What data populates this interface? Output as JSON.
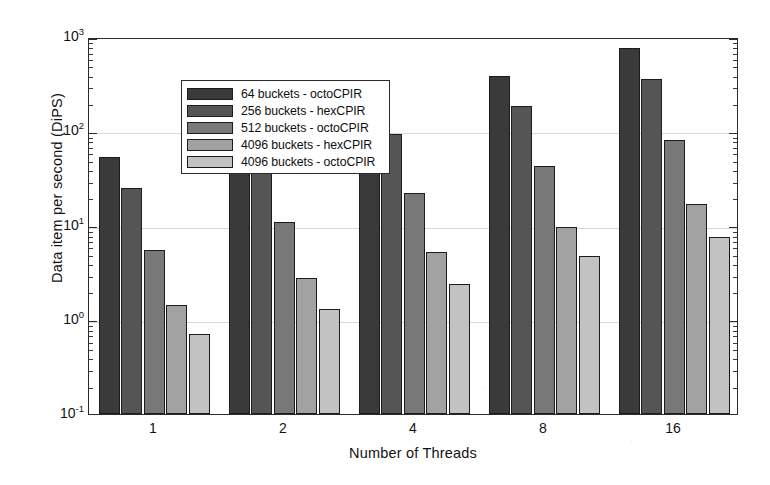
{
  "chart_data": {
    "type": "bar",
    "title": "",
    "xlabel": "Number of Threads",
    "ylabel": "Data item per second (DiPS)",
    "yscale": "log",
    "ylim": [
      0.1,
      1000
    ],
    "ytick_labels": [
      "10³",
      "10²",
      "10¹",
      "10⁰",
      "10⁻¹"
    ],
    "ytick_bases": [
      "10",
      "10",
      "10",
      "10",
      "10"
    ],
    "ytick_exponents": [
      "3",
      "2",
      "1",
      "0",
      "-1"
    ],
    "ytick_values": [
      1000,
      100,
      10,
      1,
      0.1
    ],
    "categories": [
      "1",
      "2",
      "4",
      "8",
      "16"
    ],
    "grid": true,
    "legend_position": "upper left",
    "series": [
      {
        "name": "64 buckets - octoCPIR",
        "color": "#3a3a3a",
        "values": [
          53,
          95,
          200,
          390,
          760
        ]
      },
      {
        "name": "256 buckets - hexCPIR",
        "color": "#555555",
        "values": [
          25,
          48,
          93,
          185,
          360
        ]
      },
      {
        "name": "512 buckets - octoCPIR",
        "color": "#787878",
        "values": [
          5.5,
          11,
          22,
          43,
          80
        ]
      },
      {
        "name": "4096 buckets - hexCPIR",
        "color": "#a2a2a2",
        "values": [
          1.45,
          2.8,
          5.3,
          9.7,
          17
        ]
      },
      {
        "name": "4096 buckets - octoCPIR",
        "color": "#c2c2c2",
        "values": [
          0.7,
          1.3,
          2.4,
          4.7,
          7.6
        ]
      }
    ]
  }
}
